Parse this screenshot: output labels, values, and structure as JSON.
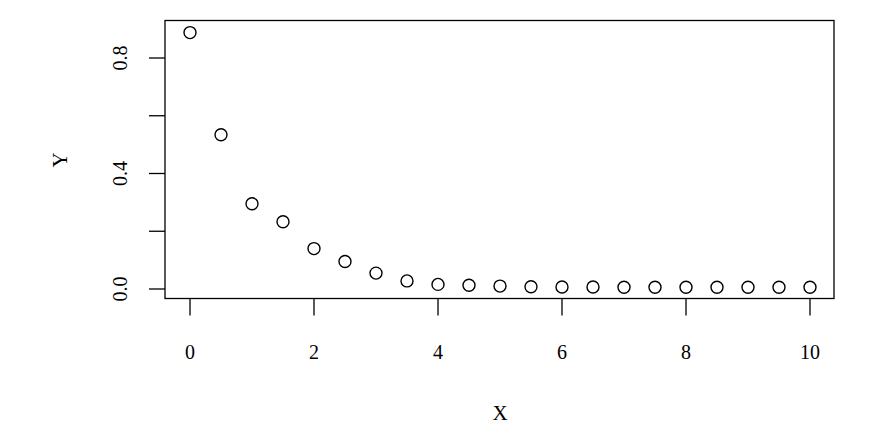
{
  "chart_data": {
    "type": "scatter",
    "title": "",
    "xlabel": "X",
    "ylabel": "Y",
    "xlim": [
      -0.4,
      10.4
    ],
    "ylim": [
      -0.03,
      0.925
    ],
    "x_ticks": [
      0,
      2,
      4,
      6,
      8,
      10
    ],
    "x_tick_labels": [
      "0",
      "2",
      "4",
      "6",
      "8",
      "10"
    ],
    "y_ticks": [
      0.0,
      0.2,
      0.4,
      0.6,
      0.8
    ],
    "y_tick_labels": [
      "0.0",
      "",
      "0.4",
      "",
      "0.8"
    ],
    "grid": false,
    "legend": null,
    "marker": "open-circle",
    "series": [
      {
        "name": "Y",
        "x": [
          0,
          0.5,
          1,
          1.5,
          2,
          2.5,
          3,
          3.5,
          4,
          4.5,
          5,
          5.5,
          6,
          6.5,
          7,
          7.5,
          8,
          8.5,
          9,
          9.5,
          10
        ],
        "y": [
          0.888,
          0.534,
          0.295,
          0.233,
          0.14,
          0.095,
          0.055,
          0.028,
          0.016,
          0.013,
          0.01,
          0.008,
          0.007,
          0.007,
          0.006,
          0.006,
          0.006,
          0.006,
          0.006,
          0.006,
          0.006
        ]
      }
    ]
  },
  "colors": {
    "axis": "#000000",
    "marker_stroke": "#000000",
    "background": "#ffffff"
  }
}
